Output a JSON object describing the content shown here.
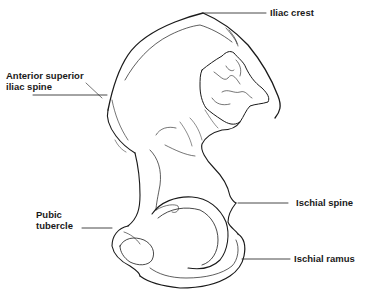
{
  "diagram": {
    "colors": {
      "line": "#1a1a1a",
      "background": "#ffffff"
    },
    "labels": {
      "iliac_crest": "Iliac crest",
      "asis_line1": "Anterior superior",
      "asis_line2": "iliac spine",
      "ischial_spine": "Ischial spine",
      "pubic_line1": "Pubic",
      "pubic_line2": "tubercle",
      "ischial_ramus": "Ischial ramus"
    }
  }
}
